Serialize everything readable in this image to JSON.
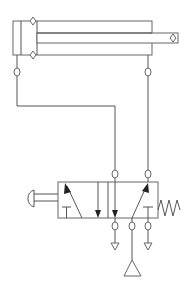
{
  "diagram": {
    "type": "pneumatic-circuit",
    "components": [
      {
        "id": "cylinder",
        "kind": "double-acting-cylinder",
        "ports": 2
      },
      {
        "id": "valve",
        "kind": "5/2-directional-control-valve",
        "actuation": "push-button",
        "return": "spring"
      },
      {
        "id": "pressure-source",
        "kind": "compressed-air-supply"
      },
      {
        "id": "exhaust-1",
        "kind": "exhaust"
      },
      {
        "id": "exhaust-2",
        "kind": "exhaust"
      }
    ],
    "connections": [
      {
        "from": "cylinder.port_cap",
        "to": "valve.port_4"
      },
      {
        "from": "cylinder.port_rod",
        "to": "valve.port_2"
      },
      {
        "from": "pressure-source",
        "to": "valve.port_1"
      },
      {
        "from": "valve.port_5",
        "to": "exhaust-1"
      },
      {
        "from": "valve.port_3",
        "to": "exhaust-2"
      }
    ],
    "colors": {
      "line": "#555555",
      "background": "#ffffff",
      "arrowhead": "#222222"
    }
  }
}
